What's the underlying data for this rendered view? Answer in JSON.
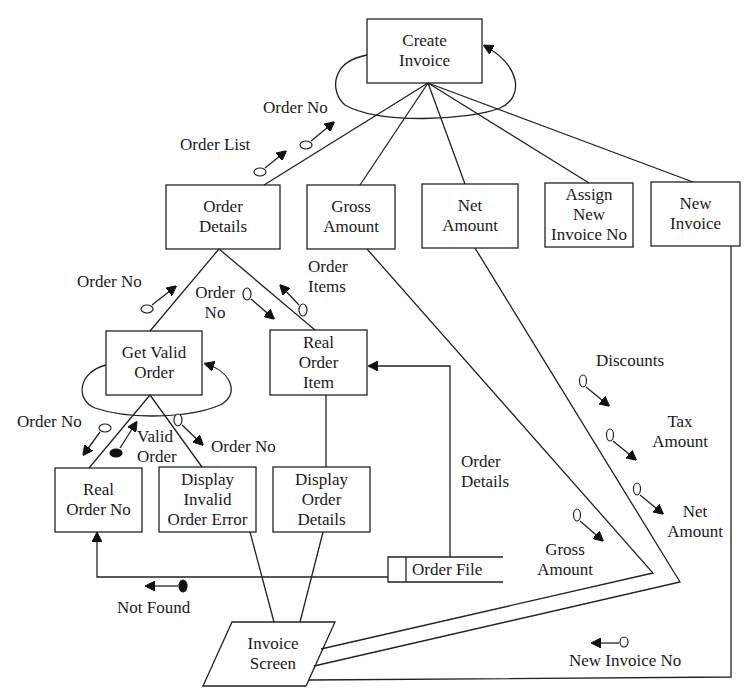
{
  "diagram": {
    "type": "structure-chart",
    "colors": {
      "line": "#222222",
      "background": "#ffffff",
      "text": "#1a1a1a"
    },
    "modules": {
      "create_invoice": "Create\nInvoice",
      "order_details": "Order\nDetails",
      "gross_amount": "Gross\nAmount",
      "net_amount": "Net\nAmount",
      "assign_new_invoice_no": "Assign\nNew\nInvoice No",
      "new_invoice": "New\nInvoice",
      "get_valid_order": "Get  Valid\nOrder",
      "real_order_item": "Real\nOrder\nItem",
      "real_order_no": "Real\nOrder No",
      "display_invalid_order_error": "Display\nInvalid\nOrder Error",
      "display_order_details": "Display\nOrder\nDetails"
    },
    "data_store": {
      "order_file": "Order  File"
    },
    "screen": {
      "invoice_screen": "Invoice\nScreen"
    },
    "couples": {
      "order_no_top": "Order  No",
      "order_list": "Order  List",
      "order_no_left": "Order  No",
      "order_no_mid": "Order\nNo",
      "order_items": "Order\nItems",
      "order_no_gvo_left": "Order  No",
      "valid_order": "Valid\nOrder",
      "order_no_gvo_right": "Order  No",
      "not_found": "Not  Found",
      "order_details_flow": "Order\nDetails",
      "discounts": "Discounts",
      "tax_amount": "Tax\nAmount",
      "net_amount_flow": "Net\nAmount",
      "gross_amount_flow": "Gross\nAmount",
      "new_invoice_no_flow": "New  Invoice  No"
    },
    "connections": [
      {
        "from": "Create Invoice",
        "to": "Order Details"
      },
      {
        "from": "Create Invoice",
        "to": "Gross Amount"
      },
      {
        "from": "Create Invoice",
        "to": "Net Amount"
      },
      {
        "from": "Create Invoice",
        "to": "Assign New Invoice No"
      },
      {
        "from": "Create Invoice",
        "to": "New Invoice"
      },
      {
        "from": "Order Details",
        "to": "Get Valid Order"
      },
      {
        "from": "Order Details",
        "to": "Real Order Item"
      },
      {
        "from": "Get Valid Order",
        "to": "Real Order No"
      },
      {
        "from": "Get Valid Order",
        "to": "Display Invalid Order Error"
      },
      {
        "from": "Real Order Item",
        "to": "Display Order Details"
      },
      {
        "from": "Order File",
        "to": "Real Order Item"
      },
      {
        "from": "Order File",
        "to": "Real Order No"
      },
      {
        "from": "Display Invalid Order Error",
        "to": "Invoice Screen"
      },
      {
        "from": "Display Order Details",
        "to": "Invoice Screen"
      },
      {
        "from": "Gross Amount",
        "to": "Invoice Screen"
      },
      {
        "from": "Net Amount",
        "to": "Invoice Screen"
      },
      {
        "from": "New Invoice",
        "to": "Invoice Screen"
      }
    ],
    "loops": [
      "Create Invoice",
      "Get Valid Order"
    ]
  }
}
